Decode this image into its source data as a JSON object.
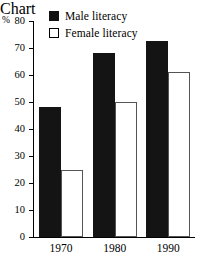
{
  "chart_data": {
    "type": "bar",
    "title": "",
    "xlabel": "",
    "ylabel": "%",
    "unit_label": "%",
    "categories": [
      "1970",
      "1980",
      "1990"
    ],
    "series": [
      {
        "name": "Male literacy",
        "values": [
          48,
          68,
          72.5
        ],
        "swatch": "filled"
      },
      {
        "name": "Female literacy",
        "values": [
          25,
          50,
          61
        ],
        "swatch": "hollow"
      }
    ],
    "ylim": [
      0,
      80
    ],
    "ytick_labels": [
      "0",
      "10",
      "20",
      "30",
      "40",
      "50",
      "60",
      "70",
      "80"
    ],
    "ytick_values": [
      0,
      10,
      20,
      30,
      40,
      50,
      60,
      70,
      80
    ],
    "grid": false,
    "legend_position": "top-center",
    "colors": {
      "male": "#141414",
      "female": "#ffffff",
      "female_border": "#555555",
      "axis": "#000000",
      "background": "#ffffff"
    }
  }
}
